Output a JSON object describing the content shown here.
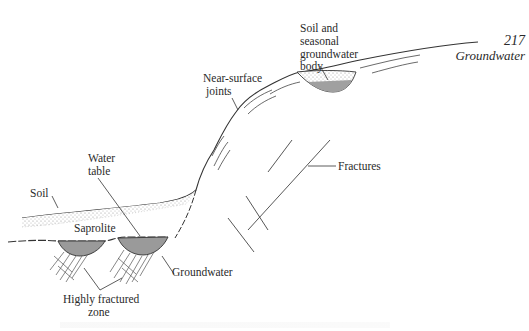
{
  "page": {
    "number": "217",
    "running_title": "Groundwater"
  },
  "figure": {
    "labels": {
      "soil_seasonal": [
        "Soil and",
        "seasonal",
        "groundwater",
        "body"
      ],
      "near_surface_joints": [
        "Near-surface",
        "joints"
      ],
      "fractures": "Fractures",
      "water_table": [
        "Water",
        "table"
      ],
      "soil": "Soil",
      "saprolite": "Saprolite",
      "groundwater": "Groundwater",
      "highly_fractured_zone": [
        "Highly fractured",
        "zone"
      ]
    },
    "colors": {
      "line": "#333333",
      "groundwater_fill": "#9a9a9a",
      "soil_stipple": "#b8b8b8"
    }
  }
}
